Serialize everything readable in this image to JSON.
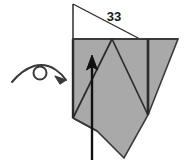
{
  "diagram": {
    "step_number_label": "33",
    "colors": {
      "paper_fill": "#a9a9a9",
      "paper_fill_white": "#ffffff",
      "outline": "#3a3a3a",
      "crease": "#2b2b2b",
      "arrow": "#111111",
      "label_text": "#1a1a1a",
      "background": "#ffffff"
    },
    "symbols": {
      "turn_over": {
        "name": "turn-over-symbol",
        "description": "arc with small circle loop and arrowhead indicating turn the model over"
      },
      "valley_arrow": {
        "name": "fold-direction-arrow",
        "description": "straight arrow pointing upward indicating fold direction"
      }
    },
    "shapes": {
      "white_triangle_points": "73,4 73,39 140,39",
      "gray_body_points": "73,39 178,39 148,115 124,158 97,131 73,118",
      "outline_left_edge": {
        "x1": 73,
        "y1": 39,
        "x2": 73,
        "y2": 118
      },
      "outline_top_edge": {
        "x1": 73,
        "y1": 39,
        "x2": 178,
        "y2": 39
      },
      "crease_v_left": {
        "x1": 112,
        "y1": 39,
        "x2": 73,
        "y2": 118
      },
      "crease_v_right": {
        "x1": 112,
        "y1": 39,
        "x2": 148,
        "y2": 115
      },
      "crease_vertical_thick": {
        "x1": 148,
        "y1": 39,
        "x2": 148,
        "y2": 115
      },
      "crease_hypotenuse": {
        "x1": 73,
        "y1": 4,
        "x2": 140,
        "y2": 39
      },
      "arrow_shaft": {
        "x1": 92,
        "y1": 160,
        "x2": 92,
        "y2": 64
      },
      "arrow_tip": {
        "x": 92,
        "y": 56
      }
    },
    "label_position": {
      "x": 114,
      "y": 21
    }
  }
}
